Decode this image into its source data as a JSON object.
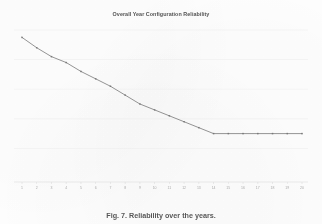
{
  "figure": {
    "title": "Overall Year Configuration Reliability",
    "caption": "Fig. 7.  Reliability over the years.",
    "background_color": "#fefefe",
    "line_color": "#6b6b6b",
    "grid_color": "#e9e9e9",
    "axis_color": "#cfcfcf",
    "title_color": "#3a3a3a",
    "tick_label_color": "#9a9a9a"
  },
  "chart_data": {
    "type": "line",
    "title": "Overall Year Configuration Reliability",
    "xlabel": "",
    "ylabel": "",
    "x": [
      1,
      2,
      3,
      4,
      5,
      6,
      7,
      8,
      9,
      10,
      11,
      12,
      13,
      14,
      15,
      16,
      17,
      18,
      19,
      20
    ],
    "categories": [
      "1",
      "2",
      "3",
      "4",
      "5",
      "6",
      "7",
      "8",
      "9",
      "10",
      "11",
      "12",
      "13",
      "14",
      "15",
      "16",
      "17",
      "18",
      "19",
      "20"
    ],
    "series": [
      {
        "name": "Overall Year Configuration Reliability",
        "values": [
          0.95,
          0.88,
          0.82,
          0.78,
          0.72,
          0.67,
          0.62,
          0.56,
          0.5,
          0.46,
          0.42,
          0.38,
          0.34,
          0.3,
          0.3,
          0.3,
          0.3,
          0.3,
          0.3,
          0.3
        ],
        "color": "#6b6b6b",
        "marker": "dot"
      }
    ],
    "xlim": [
      1,
      20
    ],
    "ylim": [
      0,
      1
    ],
    "grid": true,
    "gridlines_y": [
      0.2,
      0.4,
      0.6,
      0.8,
      1.0
    ],
    "legend": false,
    "legend_position": "none",
    "y_tick_labels_visible": false
  }
}
